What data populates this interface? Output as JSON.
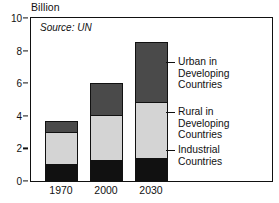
{
  "chart_data": {
    "type": "bar",
    "subtype": "stacked",
    "title": "",
    "unit_label": "Billion",
    "source_note": "Source: UN",
    "xlabel": "",
    "ylabel": "",
    "categories": [
      "1970",
      "2000",
      "2030"
    ],
    "ylim": [
      0,
      10
    ],
    "yticks": [
      0,
      2,
      4,
      6,
      8,
      10
    ],
    "ytick_labels": [
      "0",
      "2",
      "4",
      "6",
      "8",
      "10"
    ],
    "grid": false,
    "legend_position": "right-inside",
    "series": [
      {
        "name": "Industrial Countries",
        "color": "#111111",
        "values": [
          1.0,
          1.2,
          1.3
        ]
      },
      {
        "name": "Rural in Developing Countries",
        "color": "#d4d4d4",
        "values": [
          2.0,
          2.8,
          3.5
        ]
      },
      {
        "name": "Urban in Developing Countries",
        "color": "#4a4a4a",
        "values": [
          0.7,
          2.0,
          3.7
        ]
      }
    ],
    "totals": [
      3.7,
      6.0,
      8.5
    ]
  },
  "legend": {
    "entries": [
      {
        "label": "Urban in\nDeveloping\nCountries",
        "color": "#4a4a4a"
      },
      {
        "label": "Rural in\nDeveloping\nCountries",
        "color": "#d4d4d4"
      },
      {
        "label": "Industrial\nCountries",
        "color": "#111111"
      }
    ]
  },
  "caption": {
    "text": ""
  }
}
